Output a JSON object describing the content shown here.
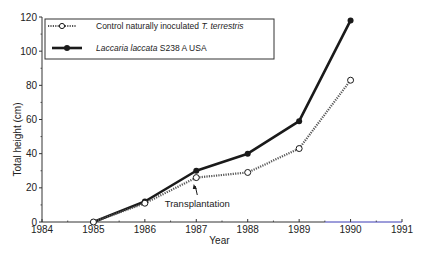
{
  "chart_data": {
    "type": "line",
    "title": "",
    "xlabel": "Year",
    "ylabel": "Total height (cm)",
    "xlim": [
      1984,
      1991
    ],
    "ylim": [
      0,
      120
    ],
    "x_ticks": [
      1984,
      1985,
      1986,
      1987,
      1988,
      1989,
      1990,
      1991
    ],
    "y_ticks": [
      0,
      20,
      40,
      60,
      80,
      100,
      120
    ],
    "grid": false,
    "legend_position": "upper left",
    "x": [
      1985,
      1986,
      1987,
      1988,
      1989,
      1990
    ],
    "series": [
      {
        "name": "Control naturally inoculated T. terrestris",
        "name_plain": "Control naturally inoculated ",
        "name_italic": "T. terrestris",
        "style": "dotted line, open circle markers",
        "values": [
          0,
          11,
          26,
          29,
          43,
          83
        ]
      },
      {
        "name": "Laccaria laccata S238 A USA",
        "name_italic": "Laccaria laccata",
        "name_plain": " S238 A USA",
        "style": "solid thick line, filled circle markers",
        "values": [
          0,
          12,
          30,
          40,
          59,
          118
        ]
      }
    ],
    "annotations": [
      {
        "text": "Transplantation",
        "x": 1987,
        "arrow_to": "Control 1987 point"
      }
    ]
  },
  "colors": {
    "line": "#1a1a1a",
    "axis": "#333333",
    "axis_right_tint": "#3b3bb5"
  }
}
